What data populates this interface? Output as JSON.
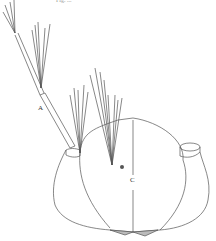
{
  "caption": "Fig. ...",
  "labels": {
    "a": "A",
    "c": "C"
  },
  "colors": {
    "line": "#555555",
    "fill": "#bbbbbb"
  }
}
